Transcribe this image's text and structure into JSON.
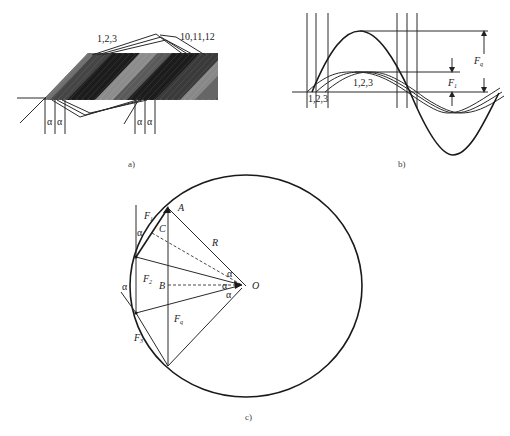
{
  "figure_a": {
    "caption": "a)",
    "coil_label_left": "1,2,3",
    "coil_label_right": "10,11,12",
    "alpha_labels": [
      "α",
      "α",
      "α",
      "α"
    ],
    "band_colors": [
      "#6a6a6a",
      "#3a3a3a",
      "#1c1c1c",
      "#8a8a8a",
      "#4a4a4a",
      "#1c1c1c",
      "#7a7a7a"
    ]
  },
  "figure_b": {
    "caption": "b)",
    "peak_label": "1,2,3",
    "base_label": "1,2,3",
    "fq_label": "F",
    "fq_sub": "q",
    "f1_label": "F",
    "f1_sub": "1"
  },
  "figure_c": {
    "caption": "c)",
    "point_A": "A",
    "point_B": "B",
    "point_C": "C",
    "point_O": "O",
    "radius_label": "R",
    "f1_label": "F",
    "f1_sub": "1",
    "f2_label": "F",
    "f2_sub": "2",
    "f3_label": "F",
    "f3_sub": "3",
    "fq_label": "F",
    "fq_sub": "q",
    "alpha": "α"
  }
}
